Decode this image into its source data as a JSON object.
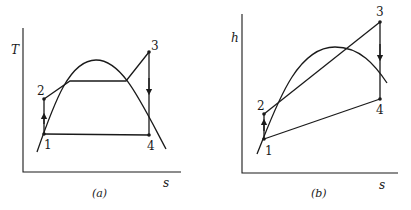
{
  "diagrams": [
    {
      "id": "a",
      "caption": "(a)",
      "y_axis_label": "T",
      "x_axis_label": "s",
      "points": [
        {
          "label": "1"
        },
        {
          "label": "2"
        },
        {
          "label": "3"
        },
        {
          "label": "4"
        }
      ]
    },
    {
      "id": "b",
      "caption": "(b)",
      "y_axis_label": "h",
      "x_axis_label": "s",
      "points": [
        {
          "label": "1"
        },
        {
          "label": "2"
        },
        {
          "label": "3"
        },
        {
          "label": "4"
        }
      ]
    }
  ]
}
